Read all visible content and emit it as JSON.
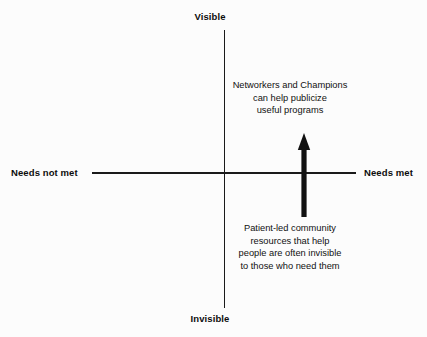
{
  "diagram": {
    "type": "quadrant-diagram",
    "background_color": "#fcfcfc",
    "line_color": "#1a1a1a",
    "text_color": "#111111",
    "axes": {
      "vertical": {
        "top_label": "Visible",
        "bottom_label": "Invisible"
      },
      "horizontal": {
        "left_label": "Needs not met",
        "right_label": "Needs met"
      }
    },
    "annotations": {
      "upper_right": {
        "lines": [
          "Networkers and Champions",
          "can help publicize",
          "useful programs"
        ]
      },
      "lower_right": {
        "lines": [
          "Patient-led community",
          "resources that help",
          "people are often invisible",
          "to those who need them"
        ]
      }
    },
    "arrow": {
      "direction": "up",
      "color": "#111111",
      "meaning": "movement from invisible toward visible while needs are met"
    }
  }
}
